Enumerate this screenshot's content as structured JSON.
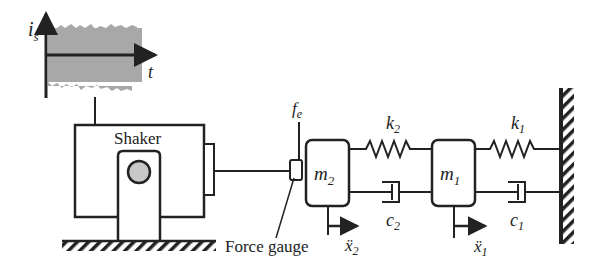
{
  "signal": {
    "y_label": "i",
    "y_sub": "s",
    "x_label": "t"
  },
  "shaker": {
    "label": "Shaker"
  },
  "force": {
    "label": "f",
    "sub": "e"
  },
  "gauge": {
    "label": "Force gauge"
  },
  "masses": [
    {
      "label": "m",
      "sub": "2",
      "accel": "ẍ",
      "accel_sub": "2"
    },
    {
      "label": "m",
      "sub": "1",
      "accel": "ẍ",
      "accel_sub": "1"
    }
  ],
  "springs": [
    {
      "label": "k",
      "sub": "2"
    },
    {
      "label": "k",
      "sub": "1"
    }
  ],
  "dampers": [
    {
      "label": "c",
      "sub": "2"
    },
    {
      "label": "c",
      "sub": "1"
    }
  ],
  "colors": {
    "line": "#222222",
    "noise": "#a0a0a0",
    "disk": "#c8c8c8"
  }
}
